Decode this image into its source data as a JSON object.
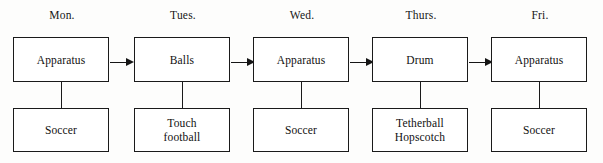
{
  "diagram": {
    "background_color": "#fdfdfc",
    "line_color": "#1a1a1a",
    "text_color": "#101010",
    "columns": [
      {
        "day": "Mon.",
        "equipment": "Apparatus",
        "activity": "Soccer",
        "has_arrow_to_next": true
      },
      {
        "day": "Tues.",
        "equipment": "Balls",
        "activity": "Touch\nfootball",
        "has_arrow_to_next": true
      },
      {
        "day": "Wed.",
        "equipment": "Apparatus",
        "activity": "Soccer",
        "has_arrow_to_next": true
      },
      {
        "day": "Thurs.",
        "equipment": "Drum",
        "activity": "Tetherball\nHopscotch",
        "has_arrow_to_next": true
      },
      {
        "day": "Fri.",
        "equipment": "Apparatus",
        "activity": "Soccer",
        "has_arrow_to_next": false
      }
    ]
  }
}
